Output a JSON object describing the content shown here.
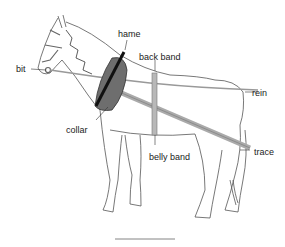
{
  "diagram": {
    "labels": {
      "hame": "hame",
      "back_band": "back band",
      "bit": "bit",
      "rein": "rein",
      "collar": "collar",
      "belly_band": "belly band",
      "trace": "trace"
    },
    "colors": {
      "outline": "#555555",
      "collar": "#6e6e6e",
      "hame": "#1a1a1a",
      "strap": "#b0b0b0",
      "text": "#222222"
    }
  }
}
